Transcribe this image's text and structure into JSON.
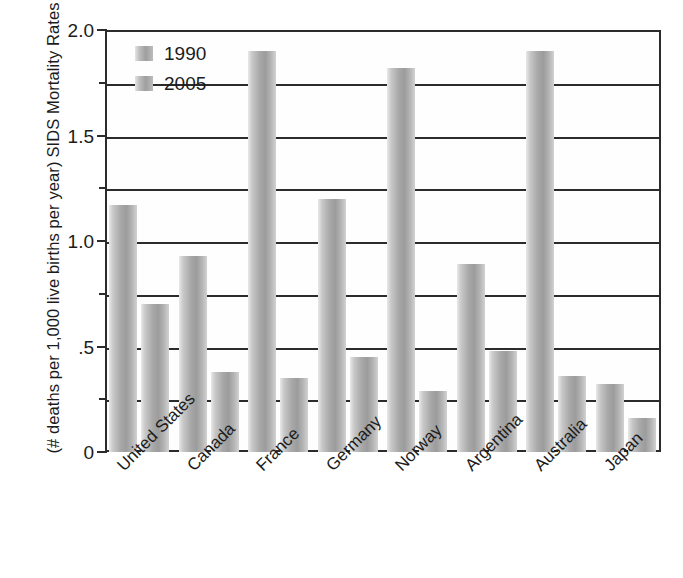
{
  "chart_data": {
    "type": "bar",
    "title": "",
    "xlabel": "",
    "ylabel_line1": "SIDS Mortality Rates",
    "ylabel_line2": "(# deaths per 1,000 live births per year)",
    "ylim": [
      0,
      2.0
    ],
    "grid": true,
    "grid_values": [
      0.25,
      0.5,
      0.75,
      1.0,
      1.25,
      1.5,
      1.75
    ],
    "ytick_major_values": [
      0,
      0.5,
      1.0,
      1.5,
      2.0
    ],
    "ytick_major_labels": [
      "0",
      ".5",
      "1.0",
      "1.5",
      "2.0"
    ],
    "ytick_minor_values": [
      0.25,
      0.75,
      1.25,
      1.75
    ],
    "legend_position": "top-left",
    "categories": [
      "United States",
      "Canada",
      "France",
      "Germany",
      "Norway",
      "Argentina",
      "Australia",
      "Japan"
    ],
    "series": [
      {
        "name": "1990",
        "values": [
          1.17,
          0.93,
          1.9,
          1.2,
          1.82,
          0.89,
          1.9,
          0.32
        ]
      },
      {
        "name": "2005",
        "values": [
          0.7,
          0.38,
          0.35,
          0.45,
          0.29,
          0.48,
          0.36,
          0.16
        ]
      }
    ],
    "colors": {
      "bar_light": "#e4e4e4",
      "bar_mid": "#a8a8a8",
      "bar_dark": "#9c9c9c",
      "axis": "#2b2b2b",
      "text": "#1c1c1c",
      "background": "#ffffff"
    }
  }
}
